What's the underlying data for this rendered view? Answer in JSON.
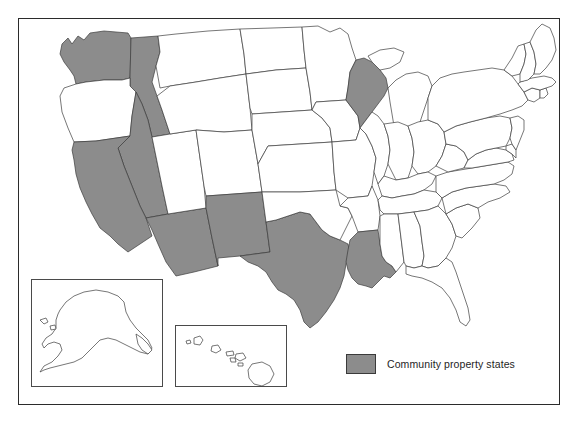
{
  "figure": {
    "kind": "choropleth-map",
    "region": "United States",
    "frame_border_color": "#2b2b2b",
    "background_color": "#ffffff"
  },
  "legend": {
    "swatch_name": "shaded-state-swatch",
    "swatch_fill": "#8c8c8c",
    "swatch_border": "#3a3a3a",
    "label": "Community property states"
  },
  "style": {
    "shaded_fill": "#8c8c8c",
    "unshaded_fill": "#ffffff",
    "state_outline": "#3c3c3c",
    "inset_border": "#4a4a4a"
  },
  "insets": [
    {
      "name": "alaska-inset",
      "shaded": false
    },
    {
      "name": "hawaii-inset",
      "shaded": false
    }
  ],
  "map_data": {
    "type": "choropleth",
    "categories": [
      "Community property states",
      "Other states"
    ],
    "shaded_states": [
      "Washington",
      "Idaho",
      "Nevada",
      "California",
      "Arizona",
      "New Mexico",
      "Texas",
      "Louisiana",
      "Wisconsin"
    ],
    "unshaded_states": [
      "Oregon",
      "Montana",
      "Wyoming",
      "Utah",
      "Colorado",
      "North Dakota",
      "South Dakota",
      "Nebraska",
      "Kansas",
      "Oklahoma",
      "Minnesota",
      "Iowa",
      "Missouri",
      "Arkansas",
      "Illinois",
      "Michigan",
      "Indiana",
      "Ohio",
      "Kentucky",
      "Tennessee",
      "Mississippi",
      "Alabama",
      "Georgia",
      "Florida",
      "South Carolina",
      "North Carolina",
      "Virginia",
      "West Virginia",
      "Maryland",
      "Delaware",
      "Pennsylvania",
      "New Jersey",
      "New York",
      "Connecticut",
      "Rhode Island",
      "Massachusetts",
      "Vermont",
      "New Hampshire",
      "Maine",
      "Alaska",
      "Hawaii"
    ],
    "shaded_count": 9,
    "total_states": 50
  }
}
